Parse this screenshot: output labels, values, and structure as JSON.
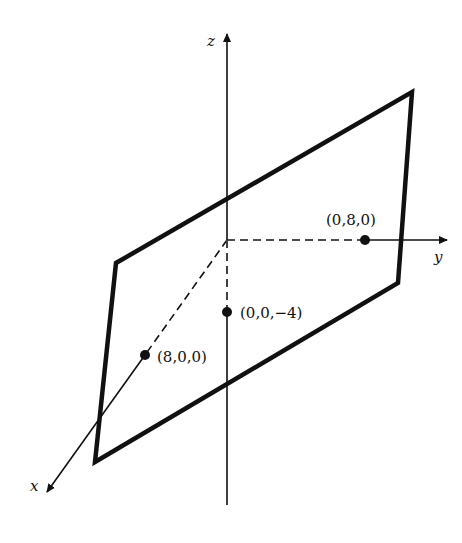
{
  "figure": {
    "axes": {
      "x_label": "x",
      "y_label": "y",
      "z_label": "z"
    },
    "points": [
      {
        "label": "(8,0,0)",
        "axis": "x"
      },
      {
        "label": "(0,8,0)",
        "axis": "y"
      },
      {
        "label": "(0,0,−4)",
        "axis": "z"
      }
    ],
    "colors": {
      "ink": "#111111",
      "background": "#ffffff"
    }
  }
}
